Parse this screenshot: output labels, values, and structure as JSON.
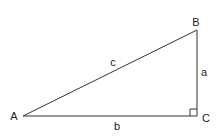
{
  "diagram": {
    "vertices": [
      {
        "id": "A",
        "label": "A",
        "x": 23,
        "y": 116
      },
      {
        "id": "B",
        "label": "B",
        "x": 197,
        "y": 30
      },
      {
        "id": "C",
        "label": "C",
        "x": 197,
        "y": 116
      }
    ],
    "sides": [
      {
        "id": "a",
        "label": "a",
        "from": "B",
        "to": "C"
      },
      {
        "id": "b",
        "label": "b",
        "from": "A",
        "to": "C"
      },
      {
        "id": "c",
        "label": "c",
        "from": "A",
        "to": "B"
      }
    ],
    "right_angle_at": "C",
    "colors": {
      "stroke": "#333333",
      "text": "#222222",
      "background": "#ffffff"
    }
  }
}
